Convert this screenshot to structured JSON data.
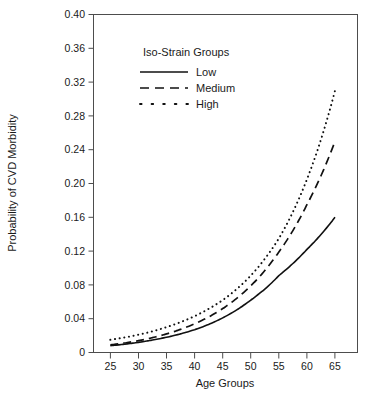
{
  "chart_data": {
    "type": "line",
    "title": "",
    "xlabel": "Age Groups",
    "ylabel": "Probability of CVD Morbidity",
    "xlim": [
      22,
      69
    ],
    "ylim": [
      0,
      0.4
    ],
    "grid": false,
    "legend_position": "top-center-inside",
    "legend_title": "Iso-Strain Groups",
    "xticks": [
      25,
      30,
      35,
      40,
      45,
      50,
      55,
      60,
      65
    ],
    "xtick_labels": [
      "25",
      "30",
      "35",
      "40",
      "45",
      "50",
      "55",
      "60",
      "65"
    ],
    "yticks": [
      0,
      0.04,
      0.08,
      0.12,
      0.16,
      0.2,
      0.24,
      0.28,
      0.32,
      0.36,
      0.4
    ],
    "ytick_labels": [
      "0",
      "0.04",
      "0.08",
      "0.12",
      "0.16",
      "0.20",
      "0.24",
      "0.28",
      "0.32",
      "0.36",
      "0.40"
    ],
    "x": [
      25,
      30,
      35,
      40,
      45,
      50,
      55,
      60,
      65
    ],
    "series": [
      {
        "name": "Low",
        "style": "solid",
        "color": "#111111",
        "values": [
          0.008,
          0.012,
          0.018,
          0.027,
          0.041,
          0.062,
          0.091,
          0.122,
          0.16
        ]
      },
      {
        "name": "Medium",
        "style": "dashed",
        "color": "#111111",
        "values": [
          0.009,
          0.014,
          0.022,
          0.034,
          0.052,
          0.079,
          0.119,
          0.175,
          0.25
        ]
      },
      {
        "name": "High",
        "style": "dotted",
        "color": "#111111",
        "values": [
          0.015,
          0.021,
          0.03,
          0.043,
          0.062,
          0.091,
          0.135,
          0.205,
          0.31
        ]
      }
    ]
  },
  "axes": {
    "y_axis_label": "Probability of CVD Morbidity",
    "x_axis_label": "Age Groups",
    "ytick_0": "0.40",
    "ytick_1": "0.36",
    "ytick_2": "0.32",
    "ytick_3": "0.28",
    "ytick_4": "0.24",
    "ytick_5": "0.20",
    "ytick_6": "0.16",
    "ytick_7": "0.12",
    "ytick_8": "0.08",
    "ytick_9": "0.04",
    "ytick_10": "0",
    "xtick_0": "25",
    "xtick_1": "30",
    "xtick_2": "35",
    "xtick_3": "40",
    "xtick_4": "45",
    "xtick_5": "50",
    "xtick_6": "55",
    "xtick_7": "60",
    "xtick_8": "65"
  },
  "legend": {
    "title": "Iso-Strain Groups",
    "items": [
      {
        "label": "Low",
        "style": "solid"
      },
      {
        "label": "Medium",
        "style": "dashed"
      },
      {
        "label": "High",
        "style": "dotted"
      }
    ]
  }
}
